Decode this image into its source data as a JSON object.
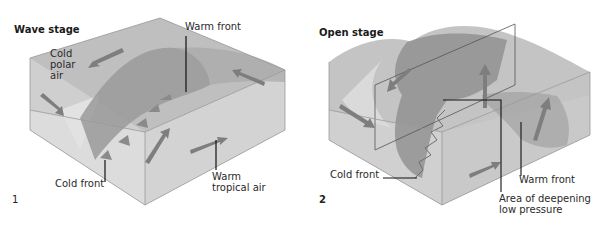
{
  "figure": {
    "panels": [
      {
        "number": "1",
        "title": "Wave stage",
        "labels": {
          "cold_air": "Cold polar air",
          "cold_air_lines": [
            "Cold",
            "polar",
            "air"
          ],
          "warm_front": "Warm front",
          "cold_front": "Cold front",
          "warm_air": "Warm tropical air",
          "warm_air_lines": [
            "Warm",
            "tropical air"
          ]
        }
      },
      {
        "number": "2",
        "title": "Open stage",
        "labels": {
          "cold_front": "Cold front",
          "warm_front": "Warm front",
          "low_pressure": "Area of deepening low pressure",
          "low_pressure_lines": [
            "Area of deepening",
            "low pressure"
          ]
        }
      }
    ],
    "colors": {
      "box_face_light": "#d2d2d2",
      "box_face_mid": "#b9b9b9",
      "front_surface": "#8f8f8f",
      "arrow": "#7e7e7e",
      "leader_line": "#111111",
      "text": "#2a2a2a"
    }
  }
}
